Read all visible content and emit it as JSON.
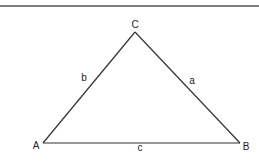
{
  "diagram": {
    "type": "triangle",
    "top_rule": {
      "y": 6,
      "color": "#555555"
    },
    "stroke_color": "#333333",
    "vertices": {
      "A": {
        "label": "A",
        "x": 43,
        "y": 143
      },
      "B": {
        "label": "B",
        "x": 240,
        "y": 143
      },
      "C": {
        "label": "C",
        "x": 135,
        "y": 32
      }
    },
    "sides": {
      "a": {
        "label": "a",
        "between": [
          "B",
          "C"
        ]
      },
      "b": {
        "label": "b",
        "between": [
          "A",
          "C"
        ]
      },
      "c": {
        "label": "c",
        "between": [
          "A",
          "B"
        ]
      }
    }
  }
}
